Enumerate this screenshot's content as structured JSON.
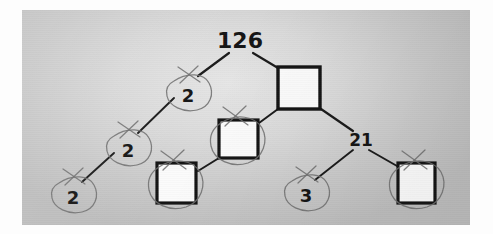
{
  "image": {
    "kind": "photograph-of-worksheet",
    "subject": "hand-marked factor tree diagram",
    "paper_background": "#dadada",
    "border_color": "#fdfdfd",
    "ink_color": "#141414",
    "pencil_mark_color": "#6f6f6f"
  },
  "diagram": {
    "type": "factor-tree",
    "title": "",
    "root_value": "126",
    "nodes": [
      {
        "id": "root",
        "label": "126",
        "shape": "text",
        "x": 218,
        "y": 32,
        "annotated": false
      },
      {
        "id": "n-2a",
        "label": "2",
        "shape": "text",
        "x": 163,
        "y": 78,
        "annotated": true
      },
      {
        "id": "box-63",
        "label": "",
        "shape": "box",
        "x": 278,
        "y": 78,
        "annotated": false
      },
      {
        "id": "n-2b",
        "label": "2",
        "shape": "text",
        "x": 103,
        "y": 133,
        "annotated": true
      },
      {
        "id": "box-mid",
        "label": "",
        "shape": "box",
        "x": 217,
        "y": 129,
        "annotated": true
      },
      {
        "id": "n-21",
        "label": "21",
        "shape": "text",
        "x": 338,
        "y": 130,
        "annotated": false
      },
      {
        "id": "n-2c",
        "label": "2",
        "shape": "text",
        "x": 48,
        "y": 180,
        "annotated": true
      },
      {
        "id": "box-low",
        "label": "",
        "shape": "box",
        "x": 155,
        "y": 173,
        "annotated": true
      },
      {
        "id": "n-3",
        "label": "3",
        "shape": "text",
        "x": 281,
        "y": 178,
        "annotated": true
      },
      {
        "id": "box-right",
        "label": "",
        "shape": "box",
        "x": 395,
        "y": 173,
        "annotated": true
      }
    ],
    "edges": [
      {
        "from": "root",
        "to": "n-2a"
      },
      {
        "from": "root",
        "to": "box-63"
      },
      {
        "from": "n-2a",
        "to": "n-2b"
      },
      {
        "from": "box-63",
        "to": "box-mid"
      },
      {
        "from": "box-63",
        "to": "n-21"
      },
      {
        "from": "n-2b",
        "to": "n-2c"
      },
      {
        "from": "box-mid",
        "to": "box-low"
      },
      {
        "from": "n-21",
        "to": "n-3"
      },
      {
        "from": "n-21",
        "to": "box-right"
      }
    ],
    "annotations": {
      "description": "each leaf node is circled in pencil and has a small pencil cross above it",
      "circle_count": 6,
      "cross_count": 6,
      "blank_box_count": 4,
      "filled_values": [
        "126",
        "2",
        "2",
        "2",
        "21",
        "3"
      ]
    }
  }
}
